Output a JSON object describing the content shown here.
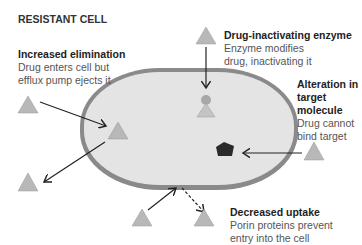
{
  "title": "RESISTANT CELL",
  "colors": {
    "cell_fill": "#e4e4e4",
    "cell_membrane": "#8a8a8a",
    "drug_triangle": "#b8b8b8",
    "target_pentagon": "#2a2a2a",
    "arrow": "#222222"
  },
  "mechanisms": [
    {
      "heading": "Increased elimination",
      "line1": "Drug enters cell but",
      "line2": "efflux pump ejects it"
    },
    {
      "heading": "Drug-inactivating enzyme",
      "line1": "Enzyme modifies",
      "line2": "drug, inactivating it"
    },
    {
      "heading_line1": "Alteration in",
      "heading_line2": "target",
      "heading_line3": "molecule",
      "line1": "Drug cannot",
      "line2": "bind target"
    },
    {
      "heading": "Decreased uptake",
      "line1": "Porin proteins prevent",
      "line2": "entry into the cell"
    }
  ]
}
